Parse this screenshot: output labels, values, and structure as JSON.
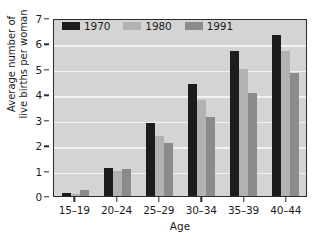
{
  "chart_data": {
    "type": "bar",
    "title": "",
    "subtitle": "",
    "xlabel": "Age",
    "ylabel_lines": [
      "Average number of",
      "live births per woman"
    ],
    "ylabel": "Average number of live births per woman",
    "categories": [
      "15–19",
      "20–24",
      "25–29",
      "30–34",
      "35–39",
      "40–44"
    ],
    "series": [
      {
        "name": "1970",
        "color": "#1c1c1c",
        "values": [
          0.12,
          1.12,
          2.87,
          4.42,
          5.7,
          6.35
        ]
      },
      {
        "name": "1980",
        "color": "#b2b2b2",
        "values": [
          0.08,
          1.0,
          2.35,
          3.78,
          5.0,
          5.72
        ]
      },
      {
        "name": "1991",
        "color": "#8b8b8b",
        "values": [
          0.25,
          1.08,
          2.1,
          3.12,
          4.05,
          4.85
        ]
      }
    ],
    "ylim": [
      0,
      7
    ],
    "ytick_values": [
      0,
      1,
      2,
      3,
      4,
      5,
      6,
      7
    ],
    "ytick_labels": [
      "0",
      "1",
      "2",
      "3",
      "4",
      "5",
      "6",
      "7"
    ],
    "grid": true,
    "grid_axis": "y",
    "grid_color": "#f2f2f2",
    "legend_position": "top-left-inside",
    "plot_background": "#d4d4d4",
    "figure_background": "#ffffff",
    "axis_color": "#2b2b2b"
  }
}
